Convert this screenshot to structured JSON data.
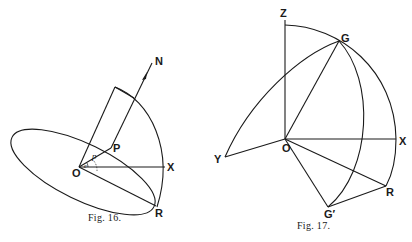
{
  "figures": [
    {
      "id": "fig16",
      "caption": "Fig. 16.",
      "labels": {
        "N": "N",
        "P": "P",
        "O": "O",
        "X": "X",
        "R": "R",
        "angle_p": "p",
        "angle_e": "e"
      }
    },
    {
      "id": "fig17",
      "caption": "Fig. 17.",
      "labels": {
        "Z": "Z",
        "G": "G",
        "O": "O",
        "X": "X",
        "Y": "Y",
        "R": "R",
        "G_prime": "G′"
      }
    }
  ]
}
